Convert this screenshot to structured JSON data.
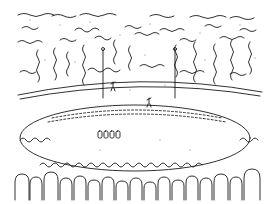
{
  "image": {
    "description": "Black-and-white pen line drawing of a stadium: dense crowd in the stands around an oval field, with floodlight poles and a few small figures on the pitch",
    "colors": {
      "ink": "#1a1a1a",
      "paper": "#ffffff",
      "stipple": "#555555"
    },
    "elements": {
      "upper_stands": "crowd of spectators rendered as wavy vertical strokes and stippling",
      "light_poles": 2,
      "field": "oval pitch with dashed inner boundary",
      "players_on_field": "small figures near center and left",
      "bench_figures": 4,
      "foreground_crowd": "heads and shoulders of spectators in front row"
    }
  }
}
